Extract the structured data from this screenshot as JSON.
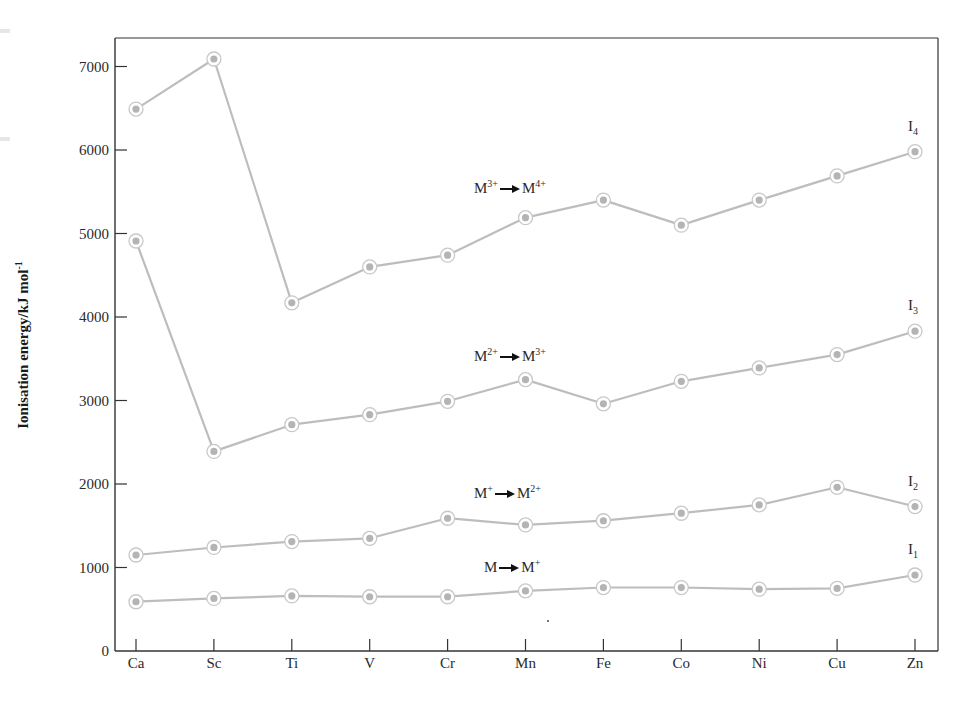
{
  "chart_data": {
    "type": "line",
    "title": "",
    "xlabel": "",
    "ylabel": "Ionisation energy/kJ mol",
    "ylabel_superscript": "-1",
    "categories": [
      "Ca",
      "Sc",
      "Ti",
      "V",
      "Cr",
      "Mn",
      "Fe",
      "Co",
      "Ni",
      "Cu",
      "Zn"
    ],
    "y_ticks": [
      0,
      1000,
      2000,
      3000,
      4000,
      5000,
      6000,
      7000
    ],
    "ylim": [
      0,
      7300
    ],
    "grid": false,
    "legend": "none (series labelled inline at right end)",
    "series": [
      {
        "name": "I1",
        "label_main": "I",
        "label_sub": "1",
        "transition": {
          "from": "M",
          "from_sup": "",
          "to": "M",
          "to_sup": "+"
        },
        "values": [
          590,
          630,
          660,
          650,
          650,
          720,
          760,
          760,
          740,
          750,
          910
        ]
      },
      {
        "name": "I2",
        "label_main": "I",
        "label_sub": "2",
        "transition": {
          "from": "M",
          "from_sup": "+",
          "to": "M",
          "to_sup": "2+"
        },
        "values": [
          1150,
          1240,
          1310,
          1350,
          1590,
          1510,
          1560,
          1650,
          1750,
          1960,
          1730
        ]
      },
      {
        "name": "I3",
        "label_main": "I",
        "label_sub": "3",
        "transition": {
          "from": "M",
          "from_sup": "2+",
          "to": "M",
          "to_sup": "3+"
        },
        "values": [
          4910,
          2390,
          2710,
          2830,
          2990,
          3250,
          2960,
          3230,
          3390,
          3550,
          3830
        ]
      },
      {
        "name": "I4",
        "label_main": "I",
        "label_sub": "4",
        "transition": {
          "from": "M",
          "from_sup": "3+",
          "to": "M",
          "to_sup": "4+"
        },
        "values": [
          6490,
          7090,
          4170,
          4600,
          4740,
          5190,
          5400,
          5100,
          5400,
          5690,
          5980
        ]
      }
    ],
    "annotations": [
      {
        "series": "I4",
        "text": "M3+ → M4+",
        "x": 474,
        "y": 178
      },
      {
        "series": "I3",
        "text": "M2+ → M3+",
        "x": 474,
        "y": 346
      },
      {
        "series": "I2",
        "text": "M+ → M2+",
        "x": 474,
        "y": 483
      },
      {
        "series": "I1",
        "text": "M → M+",
        "x": 484,
        "y": 557
      }
    ],
    "colors": {
      "line": "#bdbdbd",
      "marker_ring": "#c8c8c8",
      "marker_dot": "#b4b4b4",
      "axis": "#333333",
      "text": "#2a2a2a"
    }
  },
  "layout": {
    "plot_left": 115,
    "plot_right": 938,
    "plot_top": 38,
    "plot_bottom": 651,
    "x_first": 136,
    "x_step": 77.9,
    "px_per_unit": 0.0835
  }
}
